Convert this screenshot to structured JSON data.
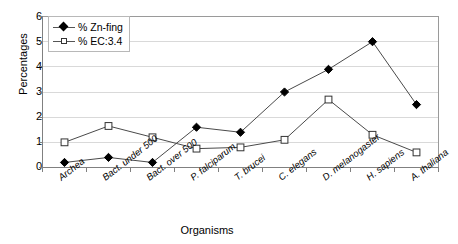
{
  "chart_data": {
    "type": "line",
    "title": "",
    "xlabel": "Organisms",
    "ylabel": "Percentages",
    "ylim": [
      0,
      6
    ],
    "yticks": [
      "0",
      "1",
      "2",
      "3",
      "4",
      "5",
      "6"
    ],
    "grid": true,
    "legend_position": "top-left",
    "categories": [
      "Archea",
      "Bact. under 500",
      "Bact. over 500",
      "P. falciparum",
      "T. brucei",
      "C. elegans",
      "D. melanogaster",
      "H. sapiens",
      "A. thaliana"
    ],
    "series": [
      {
        "name": "% Zn-fing",
        "marker": "filled-diamond",
        "color": "#000000",
        "values": [
          0.2,
          0.4,
          0.2,
          1.6,
          1.4,
          3.0,
          3.9,
          5.0,
          2.5
        ]
      },
      {
        "name": "% EC:3.4",
        "marker": "open-square",
        "color": "#333333",
        "values": [
          1.0,
          1.65,
          1.2,
          0.75,
          0.8,
          1.1,
          2.7,
          1.3,
          0.6
        ]
      }
    ]
  },
  "legend": {
    "items": [
      {
        "label": "% Zn-fing",
        "icon": "filled-diamond-marker-icon"
      },
      {
        "label": "% EC:3.4",
        "icon": "open-square-marker-icon"
      }
    ]
  },
  "axes": {
    "y_title": "Percentages",
    "x_title": "Organisms"
  },
  "colors": {
    "axis": "#808080",
    "grid": "#d9d9d9",
    "series_1": "#000000",
    "series_2": "#333333",
    "plot_background": "#ffffff"
  }
}
